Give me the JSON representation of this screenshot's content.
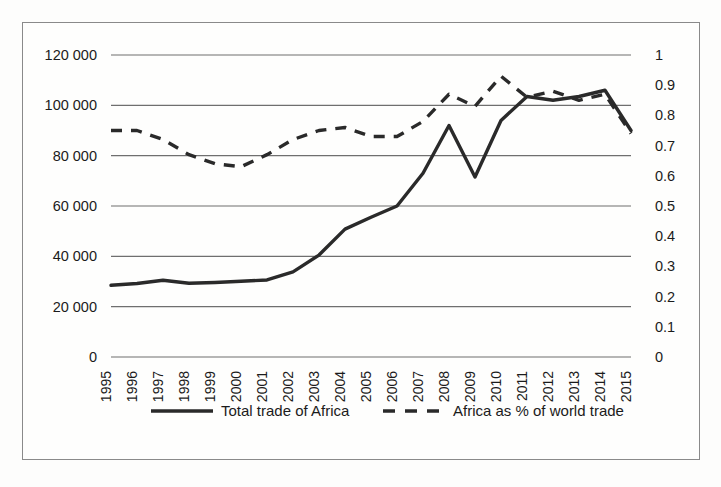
{
  "chart_data": {
    "type": "line",
    "title": "",
    "subtitle": "",
    "xlabel": "",
    "ylabel": "",
    "grid": true,
    "legend_position": "bottom",
    "x": [
      1995,
      1996,
      1997,
      1998,
      1999,
      2000,
      2001,
      2002,
      2003,
      2004,
      2005,
      2006,
      2007,
      2008,
      2009,
      2010,
      2011,
      2012,
      2013,
      2014,
      2015
    ],
    "categories": [
      "1995",
      "1996",
      "1997",
      "1998",
      "1999",
      "2000",
      "2001",
      "2002",
      "2003",
      "2004",
      "2005",
      "2006",
      "2007",
      "2008",
      "2009",
      "2010",
      "2011",
      "2012",
      "2013",
      "2014",
      "2015"
    ],
    "series": [
      {
        "name": "Total trade of Africa",
        "style": "solid",
        "axis": "left",
        "values": [
          28500,
          29200,
          30500,
          29300,
          29600,
          30100,
          30600,
          33800,
          40500,
          50800,
          55500,
          60000,
          73000,
          92000,
          71500,
          94000,
          103500,
          102000,
          103500,
          106000,
          90000
        ]
      },
      {
        "name": "Africa as % of world trade",
        "style": "dashed",
        "axis": "right",
        "values": [
          0.75,
          0.75,
          0.72,
          0.67,
          0.64,
          0.63,
          0.67,
          0.72,
          0.75,
          0.76,
          0.73,
          0.73,
          0.78,
          0.87,
          0.83,
          0.93,
          0.86,
          0.88,
          0.85,
          0.87,
          0.74
        ]
      }
    ],
    "left_axis": {
      "label": "",
      "min": 0,
      "max": 120000,
      "ticks": [
        0,
        20000,
        40000,
        60000,
        80000,
        100000,
        120000
      ],
      "tick_labels": [
        "0",
        "20 000",
        "40 000",
        "60 000",
        "80 000",
        "100 000",
        "120 000"
      ]
    },
    "right_axis": {
      "label": "",
      "min": 0,
      "max": 1,
      "ticks": [
        0,
        0.1,
        0.2,
        0.3,
        0.4,
        0.5,
        0.6,
        0.7,
        0.8,
        0.9,
        1
      ],
      "tick_labels": [
        "0",
        "0.1",
        "0.2",
        "0.3",
        "0.4",
        "0.5",
        "0.6",
        "0.7",
        "0.8",
        "0.9",
        "1"
      ]
    },
    "legend": [
      {
        "label": "Total trade of Africa",
        "style": "solid"
      },
      {
        "label": "Africa as % of world trade",
        "style": "dashed"
      }
    ]
  },
  "colors": {
    "ink": "#2a2a2a",
    "grid": "#6f6f6f",
    "frame": "#8a8a8a",
    "background": "#fefefd"
  }
}
